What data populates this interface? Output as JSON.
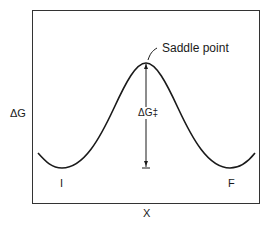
{
  "diagram": {
    "y_axis_label": "ΔG",
    "x_axis_label": "X",
    "annotation": "Saddle point",
    "barrier_label": "ΔG‡",
    "initial_state_label": "I",
    "final_state_label": "F",
    "colors": {
      "line": "#1a1a1a",
      "background": "#ffffff"
    }
  }
}
